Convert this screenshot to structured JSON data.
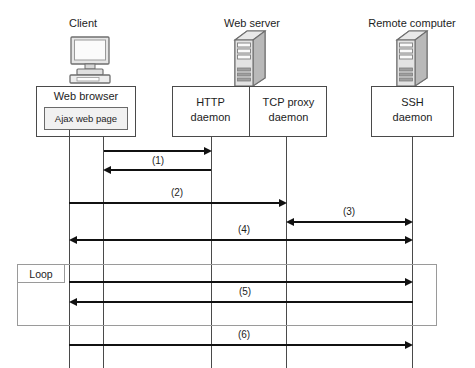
{
  "diagram": {
    "type": "uml-sequence-diagram",
    "title": "",
    "headers": [
      {
        "id": "client",
        "label": "Client"
      },
      {
        "id": "web-server",
        "label": "Web server"
      },
      {
        "id": "remote-computer",
        "label": "Remote computer"
      }
    ],
    "icons": [
      {
        "id": "client",
        "name": "desktop-computer-icon"
      },
      {
        "id": "web-server",
        "name": "server-tower-icon"
      },
      {
        "id": "remote-computer",
        "name": "server-tower-icon"
      }
    ],
    "participants": [
      {
        "id": "web-browser",
        "label": "Web browser",
        "group": "client"
      },
      {
        "id": "ajax-web-page",
        "label": "Ajax web page",
        "group": "client",
        "nested": true
      },
      {
        "id": "http-daemon",
        "label": "HTTP\ndaemon",
        "line1": "HTTP",
        "line2": "daemon",
        "group": "web-server"
      },
      {
        "id": "tcp-proxy-daemon",
        "label": "TCP proxy\ndaemon",
        "line1": "TCP proxy",
        "line2": "daemon",
        "group": "web-server"
      },
      {
        "id": "ssh-daemon",
        "label": "SSH\ndaemon",
        "line1": "SSH",
        "line2": "daemon",
        "group": "remote-computer"
      }
    ],
    "messages": [
      {
        "id": "m1a",
        "label": "",
        "from": "web-browser",
        "to": "http-daemon",
        "direction": "right"
      },
      {
        "id": "m1b",
        "label": "",
        "from": "http-daemon",
        "to": "web-browser",
        "direction": "left"
      },
      {
        "id": "m1",
        "label": "(1)"
      },
      {
        "id": "m2",
        "label": "(2)",
        "from": "ajax-web-page",
        "to": "tcp-proxy-daemon",
        "direction": "right"
      },
      {
        "id": "m3",
        "label": "(3)",
        "from": "tcp-proxy-daemon",
        "to": "ssh-daemon",
        "direction": "both"
      },
      {
        "id": "m4",
        "label": "(4)",
        "from": "ajax-web-page",
        "to": "ssh-daemon",
        "direction": "both"
      },
      {
        "id": "m5a",
        "label": "",
        "from": "ajax-web-page",
        "to": "ssh-daemon",
        "direction": "right"
      },
      {
        "id": "m5b",
        "label": "",
        "from": "ssh-daemon",
        "to": "ajax-web-page",
        "direction": "left"
      },
      {
        "id": "m5",
        "label": "(5)"
      },
      {
        "id": "m6",
        "label": "(6)",
        "from": "ajax-web-page",
        "to": "ssh-daemon",
        "direction": "right"
      }
    ],
    "fragment": {
      "id": "loop-fragment",
      "label": "Loop"
    },
    "colors": {
      "line": "#4a4a4a",
      "arrow": "#111111",
      "fragment_border": "#9a9a9a",
      "nested_fill": "#f1f1f1",
      "background": "#ffffff",
      "text": "#1d1d1d"
    }
  }
}
